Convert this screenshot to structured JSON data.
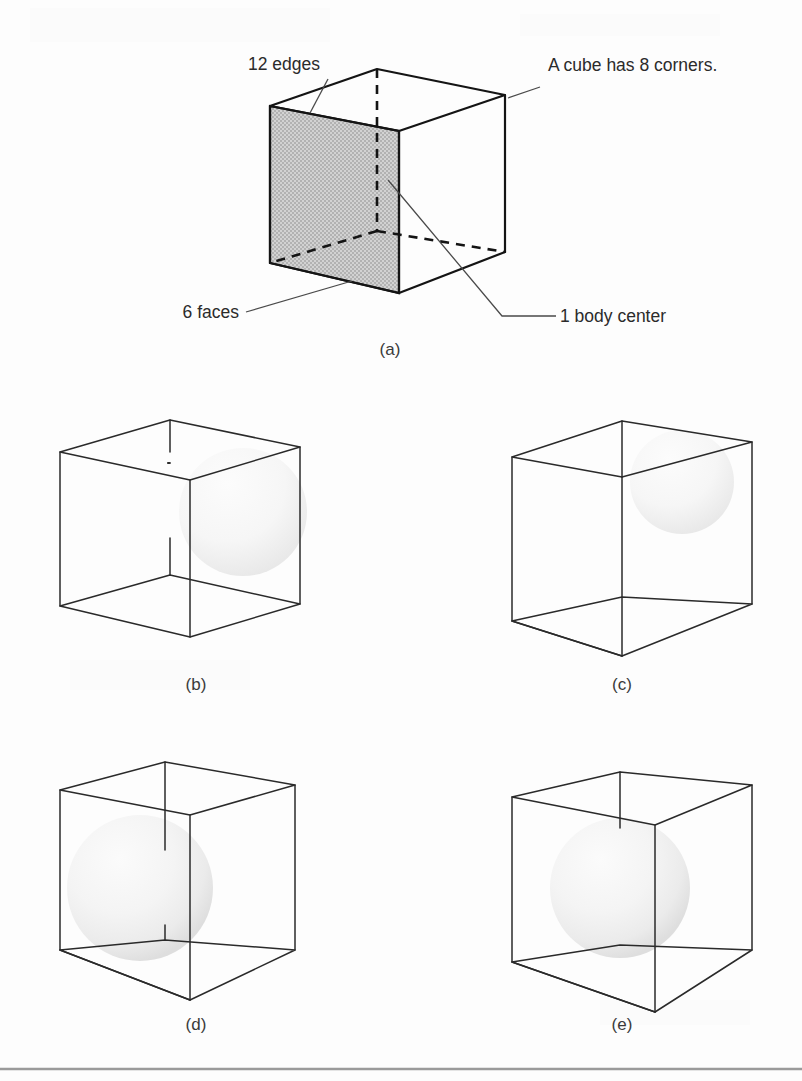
{
  "figure": {
    "type": "technical-illustration",
    "background_color": "#fdfdfd",
    "ink_color": "#141414",
    "shade_color": "#c3c3c3",
    "sphere_color": "#f2f2f2"
  },
  "panel_a": {
    "caption": "(a)",
    "annotations": [
      {
        "id": "edges",
        "text": "12 edges"
      },
      {
        "id": "corners",
        "text": "A cube has 8 corners."
      },
      {
        "id": "faces",
        "text": "6 faces"
      },
      {
        "id": "body_center",
        "text": "1 body center"
      }
    ]
  },
  "panel_b": {
    "caption": "(b)"
  },
  "panel_c": {
    "caption": "(c)"
  },
  "panel_d": {
    "caption": "(d)"
  },
  "panel_e": {
    "caption": "(e)"
  }
}
